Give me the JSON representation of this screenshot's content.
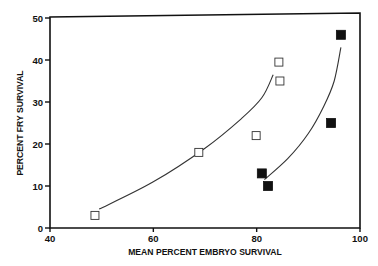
{
  "chart_data": {
    "type": "scatter",
    "title": "",
    "xlabel": "MEAN PERCENT EMBRYO SURVIVAL",
    "ylabel": "PERCENT FRY SURVIVAL",
    "xlim": [
      40,
      100
    ],
    "ylim": [
      0,
      50
    ],
    "xticks": [
      40,
      60,
      80,
      100
    ],
    "yticks": [
      0,
      10,
      20,
      30,
      40,
      50
    ],
    "grid": false,
    "legend": null,
    "series": [
      {
        "name": "open squares",
        "marker": "open-square",
        "points": [
          {
            "x": 48.7,
            "y": 3
          },
          {
            "x": 68.8,
            "y": 18
          },
          {
            "x": 79.9,
            "y": 22
          },
          {
            "x": 84.3,
            "y": 39.5
          },
          {
            "x": 84.5,
            "y": 35
          }
        ],
        "fit_curve": [
          {
            "x": 49.5,
            "y": 4.5
          },
          {
            "x": 60,
            "y": 11
          },
          {
            "x": 70,
            "y": 19
          },
          {
            "x": 77,
            "y": 26
          },
          {
            "x": 81,
            "y": 31
          },
          {
            "x": 83.2,
            "y": 36.5
          }
        ]
      },
      {
        "name": "filled squares",
        "marker": "filled-square",
        "points": [
          {
            "x": 81,
            "y": 13
          },
          {
            "x": 82.2,
            "y": 10
          },
          {
            "x": 94.4,
            "y": 25
          },
          {
            "x": 96.3,
            "y": 46
          }
        ],
        "fit_curve": [
          {
            "x": 81.5,
            "y": 11.5
          },
          {
            "x": 86,
            "y": 16.5
          },
          {
            "x": 90,
            "y": 22.5
          },
          {
            "x": 93,
            "y": 29
          },
          {
            "x": 95,
            "y": 35
          },
          {
            "x": 96.3,
            "y": 43
          }
        ]
      }
    ]
  }
}
